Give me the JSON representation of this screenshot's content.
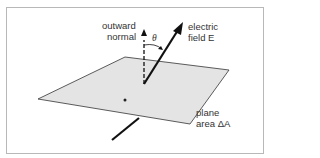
{
  "diagram": {
    "labels": {
      "normal_line1": "outward",
      "normal_line2": "normal",
      "field_line1": "electric",
      "field_line2": "field E",
      "angle": "θ",
      "plane_line1": "plane",
      "plane_line2": "area ΔA"
    },
    "colors": {
      "plane": "#e4e4e4",
      "arrow": "#111111",
      "frame": "#b8b8b8"
    }
  }
}
